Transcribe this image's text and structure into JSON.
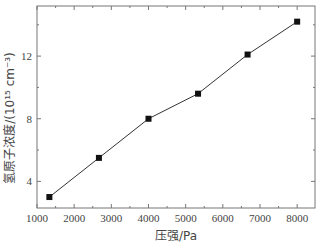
{
  "chart_data": {
    "type": "line",
    "title": "",
    "xlabel": "压强/Pa",
    "ylabel": "氢原子浓度/(10¹⁵ cm⁻³)",
    "xlim": [
      1000,
      8480
    ],
    "ylim": [
      2.3,
      15.2
    ],
    "x_ticks": [
      1000,
      2000,
      3000,
      4000,
      5000,
      6000,
      7000,
      8000
    ],
    "y_ticks": [
      4,
      8,
      12
    ],
    "grid": false,
    "legend": null,
    "marker": "square",
    "series": [
      {
        "name": "氢原子浓度",
        "x": [
          1333,
          2666,
          4000,
          5333,
          6666,
          8000
        ],
        "y": [
          3.0,
          5.5,
          8.0,
          9.6,
          12.1,
          14.2
        ]
      }
    ]
  },
  "labels": {
    "xlabel": "压强/Pa",
    "ylabel": "氢原子浓度/(10¹⁵ cm⁻³)"
  },
  "colors": {
    "axis": "#777777",
    "line": "#333333",
    "marker": "#111111"
  }
}
